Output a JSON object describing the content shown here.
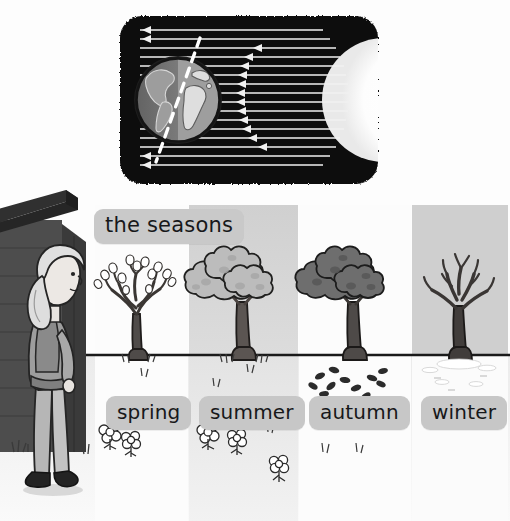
{
  "illustration": {
    "title_chip": "the seasons",
    "alt_summary": "Educational illustration: sunlight striking the tilted Earth, and four panels showing a tree through spring, summer, autumn and winter while a girl watches from beside a shed."
  },
  "space_diagram": {
    "name": "earth-sun-diagram",
    "background_color": "#0a0a0a",
    "sun": {
      "label": "sun",
      "color": "#ffffff",
      "shape": "half-disc-right-edge"
    },
    "earth": {
      "label": "earth",
      "lit_side_color": "#cfcfcf",
      "dark_side_color": "#6e6e6e",
      "ocean_color": "#9a9a9a",
      "axis_label": "tilted axis",
      "axis_style": "white dashed line"
    },
    "rays": {
      "label": "sunlight rays",
      "color": "#f2f2f2",
      "count": 22,
      "direction": "right-to-left",
      "arrowheads": true
    }
  },
  "scene": {
    "sky_color_light": "#fbfbfb",
    "sky_color_gray": "#d3d3d3",
    "ground_color": "#efefef",
    "horizon_color": "#1b1b1b",
    "shed": {
      "label": "shed",
      "wall_color": "#4a4a4a",
      "roof_color": "#2f2f2f"
    },
    "girl": {
      "label": "girl watching",
      "hair_color": "#e3e3e3",
      "skin_color": "#e8e4e0",
      "top_color": "#9c9c9c",
      "trousers_color": "#b4b4b4",
      "shoes_color": "#242424"
    },
    "panels": [
      {
        "label": "spring",
        "sky": "#fbfbfb",
        "canopy": "sparse blossom buds",
        "canopy_color": "#ffffff",
        "trunk_color": "#4e4a48",
        "ground_detail": "grass tufts and white flowers",
        "flowers": 2
      },
      {
        "label": "summer",
        "sky": "#d6d6d6",
        "canopy": "full leafy canopy",
        "canopy_color": "#b9b9b9",
        "trunk_color": "#5a5452",
        "ground_detail": "grass tufts and white flowers",
        "flowers": 3
      },
      {
        "label": "autumn",
        "sky": "#fbfbfb",
        "canopy": "dense dark canopy",
        "canopy_color": "#6f6f6f",
        "trunk_color": "#4e4a48",
        "ground_detail": "fallen leaves scattered on the ground",
        "fallen_leaves": 11
      },
      {
        "label": "winter",
        "sky": "#cfcfcf",
        "canopy": "bare branches",
        "canopy_color": "none",
        "trunk_color": "#3e3a38",
        "ground_detail": "white snowy ground",
        "snow": true
      }
    ]
  }
}
